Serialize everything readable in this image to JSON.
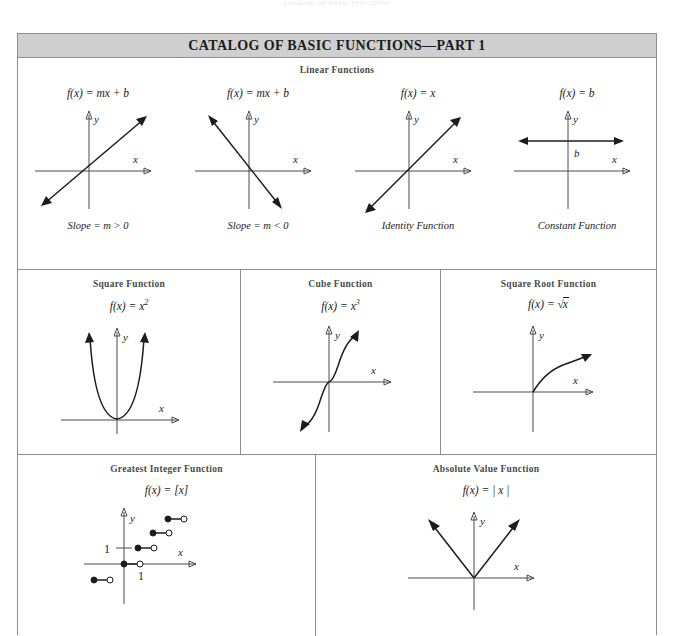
{
  "running_head": "CATALOG OF BASIC FUNCTIONS",
  "catalog": {
    "title": "CATALOG OF BASIC FUNCTIONS—PART 1",
    "title_bar_color": "#cfcfcf",
    "border_color": "#8d8d8d",
    "rows": [
      {
        "label": "Linear Functions",
        "cells": [
          {
            "formula": "f(x) = mx + b",
            "caption": "Slope = m > 0",
            "graph": "line-positive-slope",
            "axis_labels": {
              "x": "x",
              "y": "y"
            }
          },
          {
            "formula": "f(x) = mx + b",
            "caption": "Slope = m < 0",
            "graph": "line-negative-slope",
            "axis_labels": {
              "x": "x",
              "y": "y"
            }
          },
          {
            "formula": "f(x) = x",
            "caption": "Identity Function",
            "graph": "identity-line",
            "axis_labels": {
              "x": "x",
              "y": "y"
            }
          },
          {
            "formula": "f(x) = b",
            "caption": "Constant Function",
            "graph": "constant-line",
            "axis_labels": {
              "x": "x",
              "y": "y"
            },
            "value_label": "b"
          }
        ]
      },
      {
        "label": "",
        "cells": [
          {
            "title": "Square Function",
            "formula_base": "f(x) = x",
            "formula_exp": "2",
            "graph": "parabola",
            "axis_labels": {
              "x": "x",
              "y": "y"
            }
          },
          {
            "title": "Cube Function",
            "formula_base": "f(x) = x",
            "formula_exp": "3",
            "graph": "cubic",
            "axis_labels": {
              "x": "x",
              "y": "y"
            }
          },
          {
            "title": "Square Root Function",
            "formula_base": "f(x) = ",
            "formula_radicand": "x",
            "graph": "sqrt",
            "axis_labels": {
              "x": "x",
              "y": "y"
            }
          }
        ]
      },
      {
        "label": "",
        "cells": [
          {
            "title": "Greatest Integer Function",
            "formula": "f(x) = [x]",
            "graph": "step",
            "axis_labels": {
              "x": "x",
              "y": "y"
            },
            "tick_x": "1",
            "tick_y": "1"
          },
          {
            "title": "Absolute Value Function",
            "formula": "f(x) = | x |",
            "graph": "absolute-value",
            "axis_labels": {
              "x": "x",
              "y": "y"
            }
          }
        ]
      }
    ]
  }
}
